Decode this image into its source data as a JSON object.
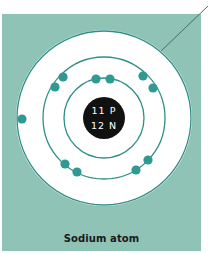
{
  "diagram": {
    "title": "Sodium atom",
    "nucleus": {
      "protons_label": "11 P",
      "neutrons_label": "12 N",
      "protons": 11,
      "neutrons": 12
    },
    "shells": [
      {
        "level": 1,
        "electrons": 2
      },
      {
        "level": 2,
        "electrons": 8
      },
      {
        "level": 3,
        "electrons": 1
      }
    ],
    "colors": {
      "background_panel": "#8fc3b6",
      "shell_ring": "#2e8f86",
      "electron": "#2e9a92",
      "nucleus": "#111111",
      "disk": "#ffffff",
      "leader_line": "#4d6a66"
    }
  }
}
